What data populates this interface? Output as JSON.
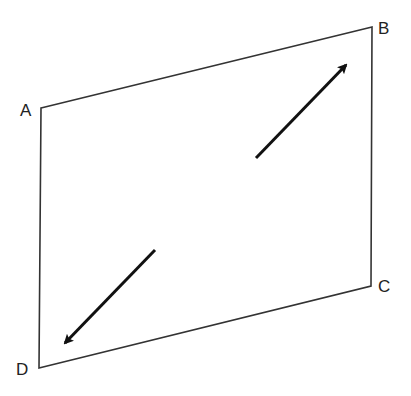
{
  "diagram": {
    "type": "parallelogram-with-arrows",
    "colors": {
      "stroke": "#333333",
      "arrow": "#111111",
      "text": "#222222",
      "background": "#ffffff"
    },
    "vertices": [
      {
        "id": "A",
        "label": "A",
        "x": 41,
        "y": 108,
        "label_x": 20,
        "label_y": 116
      },
      {
        "id": "B",
        "label": "B",
        "x": 372,
        "y": 27,
        "label_x": 378,
        "label_y": 34
      },
      {
        "id": "C",
        "label": "C",
        "x": 371,
        "y": 286,
        "label_x": 378,
        "label_y": 292
      },
      {
        "id": "D",
        "label": "D",
        "x": 39,
        "y": 368,
        "label_x": 16,
        "label_y": 375
      }
    ],
    "arrows": [
      {
        "id": "arrow-toward-B",
        "from": [
          256,
          158
        ],
        "to": [
          346,
          65
        ],
        "direction": "up-right"
      },
      {
        "id": "arrow-toward-D",
        "from": [
          155,
          250
        ],
        "to": [
          65,
          343
        ],
        "direction": "down-left"
      }
    ]
  }
}
